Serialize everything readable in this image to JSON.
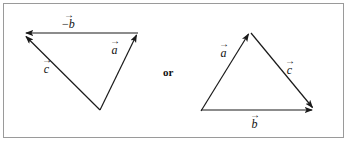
{
  "figure": {
    "connector_text": "or",
    "stroke_color": "#1a1a1a",
    "frame_color": "#9a9a9a",
    "background_color": "#ffffff"
  },
  "left_diagram": {
    "name": "triangle-a-plus-negative-b-equals-c",
    "vertices": {
      "top_left": [
        23,
        33
      ],
      "top_right": [
        138,
        32
      ],
      "bottom": [
        100,
        110
      ]
    },
    "vectors": [
      {
        "id": "neg-b",
        "label_text": "b",
        "label_prefix": "−",
        "has_overbar_arrow": true,
        "from": [
          138,
          33
        ],
        "to": [
          23,
          33
        ],
        "label_pos": [
          62,
          13
        ]
      },
      {
        "id": "a",
        "label_text": "a",
        "label_prefix": "",
        "has_overbar_arrow": true,
        "from": [
          100,
          110
        ],
        "to": [
          138,
          32
        ],
        "label_pos": [
          110,
          39
        ]
      },
      {
        "id": "c",
        "label_text": "c",
        "label_prefix": "",
        "has_overbar_arrow": true,
        "from": [
          100,
          110
        ],
        "to": [
          23,
          34
        ],
        "label_pos": [
          42,
          58
        ]
      }
    ]
  },
  "right_diagram": {
    "name": "triangle-a-plus-c-equals-b",
    "vertices": {
      "apex": [
        250,
        31
      ],
      "bottom_left": [
        201,
        111
      ],
      "bottom_right": [
        315,
        110
      ]
    },
    "vectors": [
      {
        "id": "a",
        "label_text": "a",
        "label_prefix": "",
        "has_overbar_arrow": true,
        "from": [
          201,
          111
        ],
        "to": [
          250,
          31
        ],
        "label_pos": [
          219,
          42
        ]
      },
      {
        "id": "c",
        "label_text": "c",
        "label_prefix": "",
        "has_overbar_arrow": true,
        "from": [
          251,
          33
        ],
        "to": [
          315,
          110
        ],
        "label_pos": [
          285,
          59
        ]
      },
      {
        "id": "b",
        "label_text": "b",
        "label_prefix": "",
        "has_overbar_arrow": true,
        "from": [
          201,
          110
        ],
        "to": [
          315,
          110
        ],
        "label_pos": [
          250,
          113
        ]
      }
    ]
  },
  "connector": {
    "text": "or",
    "pos": [
      163,
      67
    ]
  }
}
